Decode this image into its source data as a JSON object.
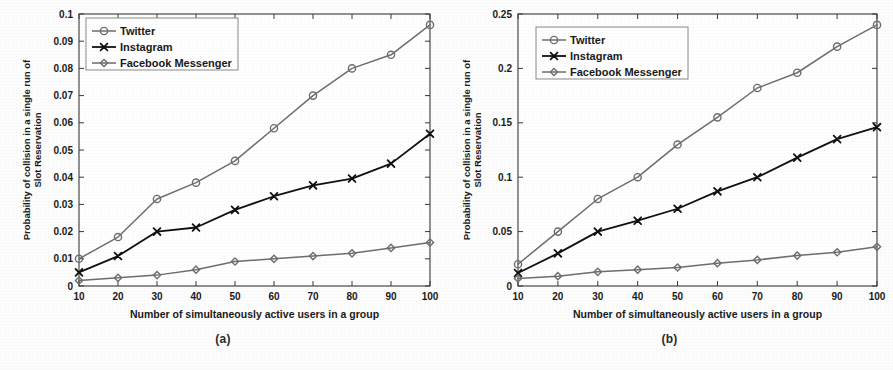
{
  "figure": {
    "background_color": "#fdfdfd",
    "subfigures": [
      {
        "caption": "(a)",
        "key": "a"
      },
      {
        "caption": "(b)",
        "key": "b"
      }
    ]
  },
  "colors": {
    "twitter": "#6e6e6e",
    "instagram": "#111111",
    "facebook_messenger": "#6e6e6e",
    "axis": "#3a3a3a",
    "text": "#1a1a1a",
    "legend_border": "#8a8a8a",
    "legend_background": "#ffffff"
  },
  "chart_data": [
    {
      "type": "line",
      "id": "subplot-a",
      "title": "",
      "subcaption": "(a)",
      "xlabel": "Number of simultaneously active users in a group",
      "ylabel": "Probability of collision in a single run of Slot Reservation",
      "x": [
        10,
        20,
        30,
        40,
        50,
        60,
        70,
        80,
        90,
        100
      ],
      "xticks": [
        10,
        20,
        30,
        40,
        50,
        60,
        70,
        80,
        90,
        100
      ],
      "xticklabels": [
        "10",
        "20",
        "30",
        "40",
        "50",
        "60",
        "70",
        "80",
        "90",
        "100"
      ],
      "xlim": [
        10,
        100
      ],
      "yticks": [
        0,
        0.01,
        0.02,
        0.03,
        0.04,
        0.05,
        0.06,
        0.07,
        0.08,
        0.09,
        0.1
      ],
      "yticklabels": [
        "0",
        "0.01",
        "0.02",
        "0.03",
        "0.04",
        "0.05",
        "0.06",
        "0.07",
        "0.08",
        "0.09",
        "0.1"
      ],
      "ylim": [
        0,
        0.1
      ],
      "grid": false,
      "legend_position": "upper left",
      "series": [
        {
          "name": "Twitter",
          "marker": "circle",
          "color": "#6e6e6e",
          "values": [
            0.01,
            0.018,
            0.032,
            0.038,
            0.046,
            0.058,
            0.07,
            0.08,
            0.085,
            0.096
          ]
        },
        {
          "name": "Instagram",
          "marker": "x",
          "color": "#111111",
          "values": [
            0.005,
            0.011,
            0.02,
            0.0215,
            0.028,
            0.033,
            0.037,
            0.0395,
            0.045,
            0.056
          ]
        },
        {
          "name": "Facebook Messenger",
          "marker": "diamond",
          "color": "#6e6e6e",
          "values": [
            0.002,
            0.003,
            0.004,
            0.006,
            0.009,
            0.01,
            0.011,
            0.012,
            0.014,
            0.016
          ]
        }
      ]
    },
    {
      "type": "line",
      "id": "subplot-b",
      "title": "",
      "subcaption": "(b)",
      "xlabel": "Number of simultaneously active users in a group",
      "ylabel": "Probability of collision in a single run of Slot Reservation",
      "x": [
        10,
        20,
        30,
        40,
        50,
        60,
        70,
        80,
        90,
        100
      ],
      "xticks": [
        10,
        20,
        30,
        40,
        50,
        60,
        70,
        80,
        90,
        100
      ],
      "xticklabels": [
        "10",
        "20",
        "30",
        "40",
        "50",
        "60",
        "70",
        "80",
        "90",
        "100"
      ],
      "xlim": [
        10,
        100
      ],
      "yticks": [
        0,
        0.05,
        0.1,
        0.15,
        0.2,
        0.25
      ],
      "yticklabels": [
        "0",
        "0.05",
        "0.1",
        "0.15",
        "0.2",
        "0.25"
      ],
      "ylim": [
        0,
        0.25
      ],
      "grid": false,
      "legend_position": "upper left",
      "series": [
        {
          "name": "Twitter",
          "marker": "circle",
          "color": "#6e6e6e",
          "values": [
            0.02,
            0.05,
            0.08,
            0.1,
            0.13,
            0.155,
            0.182,
            0.196,
            0.22,
            0.24
          ]
        },
        {
          "name": "Instagram",
          "marker": "x",
          "color": "#111111",
          "values": [
            0.012,
            0.03,
            0.05,
            0.06,
            0.071,
            0.087,
            0.1,
            0.118,
            0.135,
            0.146
          ]
        },
        {
          "name": "Facebook Messenger",
          "marker": "diamond",
          "color": "#6e6e6e",
          "values": [
            0.007,
            0.009,
            0.013,
            0.015,
            0.017,
            0.021,
            0.024,
            0.028,
            0.031,
            0.036
          ]
        }
      ]
    }
  ]
}
